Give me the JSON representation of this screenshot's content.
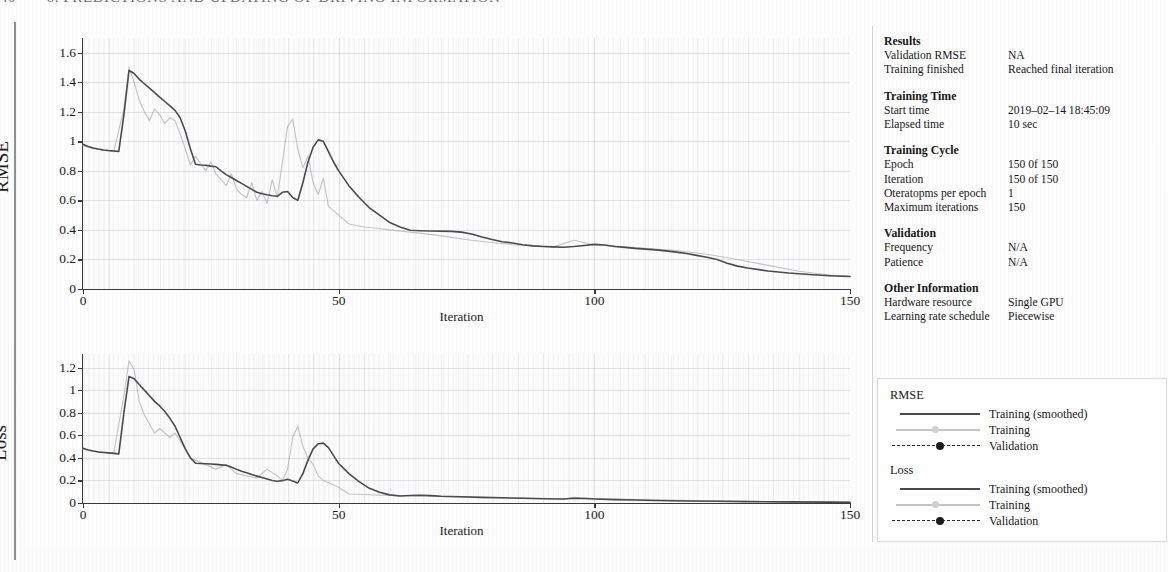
{
  "page": {
    "running_head_folio": "40",
    "running_head_title": "6. PREDICTIONS AND UPDATING OF DRIVING INFORMATION"
  },
  "info_panel": {
    "groups": [
      {
        "title": "Results",
        "rows": [
          {
            "key": "Validation RMSE",
            "value": "NA"
          },
          {
            "key": "Training finished",
            "value": "Reached final iteration"
          }
        ]
      },
      {
        "title": "Training Time",
        "rows": [
          {
            "key": "Start time",
            "value": "2019–02–14 18:45:09"
          },
          {
            "key": "Elapsed time",
            "value": "10 sec"
          }
        ]
      },
      {
        "title": "Training Cycle",
        "rows": [
          {
            "key": "Epoch",
            "value": "150 0f 150"
          },
          {
            "key": "Iteration",
            "value": "150 of 150"
          },
          {
            "key": "Oteratopms per epoch",
            "value": "1"
          },
          {
            "key": "Maximum iterations",
            "value": "150"
          }
        ]
      },
      {
        "title": "Validation",
        "rows": [
          {
            "key": "Frequency",
            "value": "N/A"
          },
          {
            "key": "Patience",
            "value": "N/A"
          }
        ]
      },
      {
        "title": "Other Information",
        "rows": [
          {
            "key": "Hardware resource",
            "value": "Single GPU"
          },
          {
            "key": "Learning rate schedule",
            "value": "Piecewise"
          }
        ]
      }
    ]
  },
  "legend": {
    "groups": [
      {
        "heading": "RMSE",
        "entries": [
          {
            "style": "solid",
            "label": "Training (smoothed)"
          },
          {
            "style": "light",
            "label": "Training"
          },
          {
            "style": "dashed",
            "label": "Validation"
          }
        ]
      },
      {
        "heading": "Loss",
        "entries": [
          {
            "style": "solid",
            "label": "Training (smoothed)"
          },
          {
            "style": "light",
            "label": "Training"
          },
          {
            "style": "dashed",
            "label": "Validation"
          }
        ]
      }
    ]
  },
  "chart_data": [
    {
      "id": "rmse",
      "type": "line",
      "title": "",
      "xlabel": "Iteration",
      "ylabel": "RMSE",
      "xlim": [
        0,
        150
      ],
      "ylim": [
        0,
        1.7
      ],
      "grid": true,
      "xticks": [
        0,
        50,
        100,
        150
      ],
      "xtick_labels": [
        "0",
        "50",
        "100",
        "150"
      ],
      "yticks": [
        0,
        0.2,
        0.4,
        0.6,
        0.8,
        1.0,
        1.2,
        1.4,
        1.6
      ],
      "ytick_labels": [
        "0",
        "0.2",
        "0.4",
        "0.6",
        "0.8",
        "1",
        "1.2",
        "1.4",
        "1.6"
      ],
      "legend_position": "external-right",
      "series": [
        {
          "name": "Training (smoothed)",
          "style": "solid",
          "color": "#4a4a4e",
          "x": [
            0,
            1,
            2,
            3,
            4,
            5,
            6,
            7,
            8,
            9,
            10,
            11,
            12,
            13,
            14,
            15,
            16,
            17,
            18,
            19,
            20,
            21,
            22,
            23,
            24,
            25,
            26,
            27,
            28,
            29,
            30,
            31,
            32,
            33,
            34,
            35,
            36,
            37,
            38,
            39,
            40,
            41,
            42,
            43,
            44,
            45,
            46,
            47,
            48,
            49,
            50,
            52,
            54,
            56,
            58,
            60,
            62,
            64,
            66,
            68,
            70,
            72,
            74,
            76,
            78,
            80,
            82,
            84,
            86,
            88,
            90,
            92,
            94,
            96,
            98,
            100,
            102,
            104,
            106,
            108,
            110,
            112,
            114,
            116,
            118,
            120,
            122,
            124,
            126,
            128,
            130,
            134,
            138,
            142,
            146,
            150
          ],
          "y": [
            0.98,
            0.965,
            0.955,
            0.948,
            0.942,
            0.938,
            0.935,
            0.932,
            1.18,
            1.48,
            1.46,
            1.42,
            1.39,
            1.36,
            1.33,
            1.3,
            1.27,
            1.24,
            1.21,
            1.16,
            1.07,
            0.95,
            0.845,
            0.84,
            0.838,
            0.832,
            0.828,
            0.8,
            0.775,
            0.755,
            0.735,
            0.715,
            0.695,
            0.675,
            0.655,
            0.645,
            0.638,
            0.632,
            0.628,
            0.655,
            0.66,
            0.62,
            0.6,
            0.72,
            0.86,
            0.96,
            1.01,
            1.0,
            0.93,
            0.86,
            0.8,
            0.7,
            0.62,
            0.55,
            0.5,
            0.45,
            0.42,
            0.398,
            0.395,
            0.393,
            0.392,
            0.39,
            0.385,
            0.372,
            0.352,
            0.335,
            0.32,
            0.312,
            0.3,
            0.292,
            0.288,
            0.285,
            0.283,
            0.288,
            0.295,
            0.302,
            0.298,
            0.288,
            0.282,
            0.275,
            0.27,
            0.265,
            0.258,
            0.25,
            0.24,
            0.228,
            0.215,
            0.2,
            0.175,
            0.155,
            0.142,
            0.122,
            0.108,
            0.098,
            0.09,
            0.085
          ]
        },
        {
          "name": "Training",
          "style": "light",
          "color": "#c3c3c8",
          "x": [
            0,
            2,
            4,
            6,
            8,
            9,
            10,
            11,
            12,
            13,
            14,
            15,
            16,
            17,
            18,
            19,
            20,
            21,
            22,
            23,
            24,
            25,
            26,
            27,
            28,
            29,
            30,
            31,
            32,
            33,
            34,
            35,
            36,
            37,
            38,
            39,
            40,
            41,
            42,
            43,
            44,
            45,
            46,
            47,
            48,
            50,
            52,
            55,
            58,
            60,
            64,
            68,
            72,
            76,
            80,
            84,
            88,
            92,
            96,
            100,
            104,
            110,
            116,
            122,
            128,
            134,
            140,
            146,
            150
          ],
          "y": [
            0.97,
            0.95,
            0.94,
            0.93,
            1.22,
            1.5,
            1.4,
            1.28,
            1.2,
            1.14,
            1.22,
            1.18,
            1.12,
            1.16,
            1.14,
            1.05,
            0.95,
            0.84,
            0.9,
            0.85,
            0.8,
            0.86,
            0.78,
            0.74,
            0.7,
            0.78,
            0.68,
            0.64,
            0.62,
            0.72,
            0.6,
            0.66,
            0.58,
            0.74,
            0.62,
            0.86,
            1.1,
            1.15,
            0.95,
            0.82,
            0.9,
            0.72,
            0.64,
            0.75,
            0.56,
            0.5,
            0.44,
            0.42,
            0.41,
            0.4,
            0.385,
            0.37,
            0.35,
            0.33,
            0.315,
            0.3,
            0.292,
            0.285,
            0.33,
            0.3,
            0.29,
            0.275,
            0.26,
            0.235,
            0.2,
            0.16,
            0.12,
            0.095,
            0.086
          ]
        }
      ]
    },
    {
      "id": "loss",
      "type": "line",
      "title": "",
      "xlabel": "Iteration",
      "ylabel": "Loss",
      "xlim": [
        0,
        150
      ],
      "ylim": [
        0,
        1.32
      ],
      "grid": true,
      "xticks": [
        0,
        50,
        100,
        150
      ],
      "xtick_labels": [
        "0",
        "50",
        "100",
        "150"
      ],
      "yticks": [
        0,
        0.2,
        0.4,
        0.6,
        0.8,
        1.0,
        1.2
      ],
      "ytick_labels": [
        "0",
        "0.2",
        "0.4",
        "0.6",
        "0.8",
        "1",
        "1.2"
      ],
      "legend_position": "external-right",
      "series": [
        {
          "name": "Training (smoothed)",
          "style": "solid",
          "color": "#4a4a4e",
          "x": [
            0,
            1,
            2,
            3,
            4,
            5,
            6,
            7,
            8,
            9,
            10,
            11,
            12,
            13,
            14,
            15,
            16,
            17,
            18,
            19,
            20,
            21,
            22,
            23,
            24,
            25,
            26,
            27,
            28,
            29,
            30,
            31,
            32,
            33,
            34,
            35,
            36,
            37,
            38,
            39,
            40,
            41,
            42,
            43,
            44,
            45,
            46,
            47,
            48,
            49,
            50,
            52,
            54,
            56,
            58,
            60,
            62,
            64,
            66,
            68,
            70,
            74,
            78,
            82,
            86,
            90,
            94,
            96,
            98,
            100,
            104,
            108,
            112,
            118,
            124,
            130,
            138,
            146,
            150
          ],
          "y": [
            0.485,
            0.47,
            0.46,
            0.452,
            0.448,
            0.444,
            0.44,
            0.435,
            0.8,
            1.12,
            1.1,
            1.05,
            1.0,
            0.95,
            0.9,
            0.86,
            0.81,
            0.75,
            0.68,
            0.58,
            0.48,
            0.4,
            0.352,
            0.35,
            0.348,
            0.345,
            0.342,
            0.338,
            0.335,
            0.318,
            0.298,
            0.282,
            0.268,
            0.252,
            0.238,
            0.225,
            0.212,
            0.2,
            0.192,
            0.198,
            0.21,
            0.195,
            0.178,
            0.26,
            0.38,
            0.48,
            0.525,
            0.53,
            0.49,
            0.42,
            0.35,
            0.26,
            0.19,
            0.13,
            0.095,
            0.072,
            0.062,
            0.066,
            0.068,
            0.065,
            0.06,
            0.055,
            0.05,
            0.046,
            0.042,
            0.038,
            0.036,
            0.042,
            0.04,
            0.036,
            0.03,
            0.026,
            0.022,
            0.018,
            0.015,
            0.012,
            0.01,
            0.008,
            0.007
          ]
        },
        {
          "name": "Training",
          "style": "light",
          "color": "#c3c3c8",
          "x": [
            0,
            2,
            4,
            6,
            8,
            9,
            10,
            11,
            12,
            13,
            14,
            15,
            16,
            17,
            18,
            19,
            20,
            21,
            22,
            24,
            26,
            28,
            30,
            32,
            34,
            36,
            38,
            39,
            40,
            41,
            42,
            43,
            44,
            45,
            46,
            47,
            48,
            50,
            52,
            55,
            58,
            62,
            66,
            70,
            76,
            82,
            88,
            94,
            96,
            100,
            106,
            114,
            122,
            130,
            140,
            150
          ],
          "y": [
            0.48,
            0.46,
            0.45,
            0.44,
            0.95,
            1.26,
            1.18,
            0.9,
            0.78,
            0.7,
            0.62,
            0.66,
            0.62,
            0.58,
            0.62,
            0.55,
            0.48,
            0.4,
            0.38,
            0.34,
            0.3,
            0.34,
            0.26,
            0.24,
            0.22,
            0.3,
            0.24,
            0.2,
            0.3,
            0.58,
            0.68,
            0.5,
            0.4,
            0.34,
            0.24,
            0.2,
            0.18,
            0.14,
            0.08,
            0.075,
            0.07,
            0.065,
            0.062,
            0.058,
            0.05,
            0.046,
            0.042,
            0.038,
            0.05,
            0.04,
            0.032,
            0.026,
            0.02,
            0.015,
            0.01,
            0.008
          ]
        }
      ]
    }
  ]
}
